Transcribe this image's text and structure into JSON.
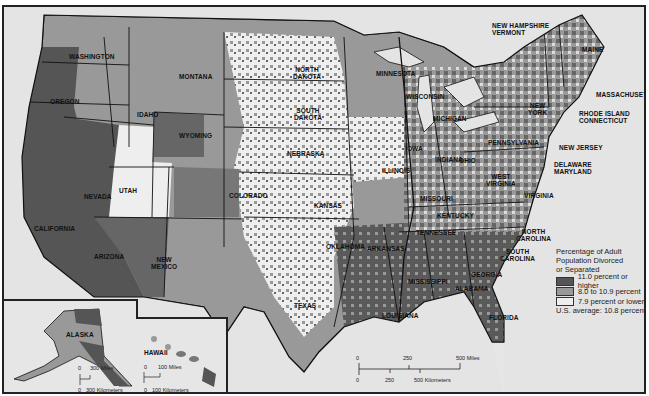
{
  "map": {
    "type": "choropleth",
    "subject": "Percentage of Adult Population Divorced or Separated",
    "colors": {
      "high": "#555555",
      "mid": "#999999",
      "low": "#eeeeee",
      "water": "#e4e4e4",
      "border": "#111111"
    },
    "state_labels": [
      {
        "name": "WASHINGTON",
        "x": 65,
        "y": 46
      },
      {
        "name": "OREGON",
        "x": 46,
        "y": 91
      },
      {
        "name": "CALIFORNIA",
        "x": 30,
        "y": 218
      },
      {
        "name": "NEVADA",
        "x": 80,
        "y": 186
      },
      {
        "name": "IDAHO",
        "x": 133,
        "y": 104
      },
      {
        "name": "MONTANA",
        "x": 175,
        "y": 66
      },
      {
        "name": "WYOMING",
        "x": 175,
        "y": 125
      },
      {
        "name": "UTAH",
        "x": 115,
        "y": 180
      },
      {
        "name": "COLORADO",
        "x": 225,
        "y": 185
      },
      {
        "name": "ARIZONA",
        "x": 90,
        "y": 246
      },
      {
        "name": "NEW\nMEXICO",
        "x": 147,
        "y": 249
      },
      {
        "name": "NORTH\nDAKOTA",
        "x": 289,
        "y": 59
      },
      {
        "name": "SOUTH\nDAKOTA",
        "x": 290,
        "y": 100
      },
      {
        "name": "NEBRASKA",
        "x": 283,
        "y": 143
      },
      {
        "name": "KANSAS",
        "x": 310,
        "y": 195
      },
      {
        "name": "OKLAHOMA",
        "x": 322,
        "y": 236
      },
      {
        "name": "TEXAS",
        "x": 290,
        "y": 295
      },
      {
        "name": "MINNESOTA",
        "x": 372,
        "y": 63
      },
      {
        "name": "IOWA",
        "x": 401,
        "y": 138
      },
      {
        "name": "MISSOURI",
        "x": 416,
        "y": 188
      },
      {
        "name": "ARKANSAS",
        "x": 363,
        "y": 238
      },
      {
        "name": "LOUISIANA",
        "x": 378,
        "y": 305
      },
      {
        "name": "WISCONSIN",
        "x": 402,
        "y": 86
      },
      {
        "name": "ILLINOIS",
        "x": 378,
        "y": 160
      },
      {
        "name": "MISSISSIPPI",
        "x": 404,
        "y": 271
      },
      {
        "name": "MICHIGAN",
        "x": 429,
        "y": 108
      },
      {
        "name": "INDIANA",
        "x": 431,
        "y": 149
      },
      {
        "name": "KENTUCKY",
        "x": 433,
        "y": 205
      },
      {
        "name": "TENNESSEE",
        "x": 412,
        "y": 222
      },
      {
        "name": "ALABAMA",
        "x": 451,
        "y": 278
      },
      {
        "name": "OHIO",
        "x": 455,
        "y": 150
      },
      {
        "name": "GEORGIA",
        "x": 467,
        "y": 264
      },
      {
        "name": "FLORIDA",
        "x": 485,
        "y": 307
      },
      {
        "name": "WEST\nVIRGINIA",
        "x": 482,
        "y": 166
      },
      {
        "name": "VIRGINIA",
        "x": 520,
        "y": 185
      },
      {
        "name": "NORTH\nCAROLINA",
        "x": 512,
        "y": 221
      },
      {
        "name": "SOUTH\nCAROLINA",
        "x": 496,
        "y": 241
      },
      {
        "name": "PENNSYLVANIA",
        "x": 484,
        "y": 132
      },
      {
        "name": "NEW\nYORK",
        "x": 524,
        "y": 95
      },
      {
        "name": "MAINE",
        "x": 578,
        "y": 39
      }
    ],
    "external_labels": [
      {
        "name": "NEW HAMPSHIRE\nVERMONT",
        "x": 488,
        "y": 15
      },
      {
        "name": "MASSACHUSETTS",
        "x": 592,
        "y": 84
      },
      {
        "name": "RHODE ISLAND\nCONNECTICUT",
        "x": 575,
        "y": 103
      },
      {
        "name": "NEW JERSEY",
        "x": 555,
        "y": 137
      },
      {
        "name": "DELAWARE\nMARYLAND",
        "x": 550,
        "y": 154
      }
    ],
    "insets": [
      {
        "name": "ALASKA",
        "scale": {
          "miles": "300 Miles",
          "km": "300 Kilometers",
          "zero": "0"
        }
      },
      {
        "name": "HAWAII",
        "scale": {
          "miles": "100 Miles",
          "km": "100 Kilometers",
          "zero": "0"
        }
      }
    ],
    "main_scale": {
      "miles_ticks": [
        "0",
        "250",
        "500 Miles"
      ],
      "km_ticks": [
        "0",
        "250",
        "500 Kilometers"
      ]
    }
  },
  "legend": {
    "title": "Percentage of Adult Population Divorced or Separated",
    "title_lines": [
      "Percentage of Adult",
      "Population Divorced",
      "or Separated"
    ],
    "items": [
      {
        "label": "11.0 percent or higher",
        "color": "#555555"
      },
      {
        "label": "8.0 to 10.9 percent",
        "color": "#999999"
      },
      {
        "label": "7.9 percent or lower",
        "color": "#eeeeee"
      }
    ],
    "average": "U.S. average:  10.8 percent"
  }
}
